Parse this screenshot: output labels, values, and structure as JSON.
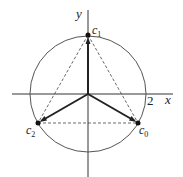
{
  "diagram": {
    "type": "complex-plane-cube-roots",
    "axes": {
      "x_label": "x",
      "y_label": "y",
      "tick_label": "2"
    },
    "circle": {
      "center": [
        88,
        94
      ],
      "radius": 58
    },
    "points": [
      {
        "name": "c0",
        "label_main": "c",
        "label_sub": "0",
        "x": 138,
        "y": 123
      },
      {
        "name": "c1",
        "label_main": "c",
        "label_sub": "1",
        "x": 88,
        "y": 35
      },
      {
        "name": "c2",
        "label_main": "c",
        "label_sub": "2",
        "x": 38,
        "y": 123
      }
    ],
    "colors": {
      "stroke": "#222222",
      "dashed": "#444444",
      "circle": "#555555"
    }
  }
}
